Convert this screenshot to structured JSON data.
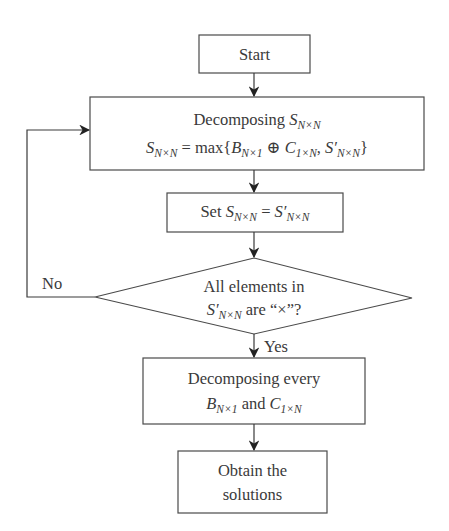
{
  "diagram": {
    "type": "flowchart",
    "nodes": {
      "start": {
        "label": "Start"
      },
      "decompose": {
        "line1_prefix": "Decomposing ",
        "line1_var": "S",
        "line1_sub": "N×N",
        "line2": {
          "lhs_var": "S",
          "lhs_sub": "N×N",
          "eq": " = max{",
          "b_var": "B",
          "b_sub": "N×1",
          "oplus": " ⊕ ",
          "c_var": "C",
          "c_sub": "1×N",
          "comma": ", ",
          "s2_var": "S′",
          "s2_sub": "N×N",
          "close": "}"
        }
      },
      "set": {
        "prefix": "Set ",
        "lhs_var": "S",
        "lhs_sub": "N×N",
        "eq": " = ",
        "rhs_var": "S′",
        "rhs_sub": "N×N"
      },
      "decision": {
        "line1": "All elements in",
        "var": "S′",
        "sub": "N×N",
        "rest": " are “×”?"
      },
      "decompose_every": {
        "line1": "Decomposing every",
        "b_var": "B",
        "b_sub": "N×1",
        "and": " and ",
        "c_var": "C",
        "c_sub": "1×N"
      },
      "obtain": {
        "line1": "Obtain the",
        "line2": "solutions"
      }
    },
    "edges": {
      "no_label": "No",
      "yes_label": "Yes"
    }
  }
}
